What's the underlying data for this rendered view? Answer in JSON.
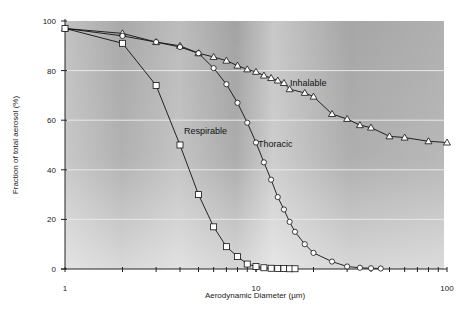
{
  "chart_data": {
    "type": "line",
    "title": "",
    "xlabel": "Aerodynamic Diameter (µm)",
    "ylabel": "Fraction of total aerosol  (%)",
    "xscale": "log",
    "xlim": [
      1,
      100
    ],
    "ylim": [
      0,
      100
    ],
    "x_tick_labels": [
      "1",
      "10",
      "100"
    ],
    "y_tick_labels": [
      "0",
      "20",
      "40",
      "60",
      "80",
      "100"
    ],
    "grid": "horizontal",
    "legend": "inline labels",
    "series": [
      {
        "name": "Inhalable",
        "marker": "triangle",
        "label_position": {
          "x": 290,
          "y": 86
        },
        "x": [
          1,
          2,
          3,
          4,
          5,
          6,
          7,
          8,
          9,
          10,
          11,
          12,
          13,
          14,
          15,
          18,
          20,
          25,
          30,
          35,
          40,
          50,
          60,
          80,
          100
        ],
        "values": [
          97,
          95,
          91.5,
          90,
          87,
          85.5,
          84,
          82,
          80.5,
          79.5,
          78,
          77,
          76,
          75,
          72.5,
          71,
          69.5,
          62.5,
          60.5,
          58,
          57,
          53.5,
          53,
          51.5,
          51
        ]
      },
      {
        "name": "Thoracic",
        "marker": "circle",
        "label_position": {
          "x": 258,
          "y": 147
        },
        "x": [
          1,
          2,
          3,
          4,
          5,
          6,
          7,
          8,
          9,
          10,
          11,
          12,
          13,
          14,
          15,
          16,
          18,
          20,
          25,
          30,
          35,
          40,
          45
        ],
        "values": [
          97,
          94,
          91.5,
          89.5,
          87,
          81,
          74.5,
          67,
          59,
          51,
          43,
          36,
          29,
          24,
          19,
          15,
          10,
          6.5,
          3,
          1,
          0.5,
          0.3,
          0.2
        ]
      },
      {
        "name": "Respirable",
        "marker": "square",
        "label_position": {
          "x": 184,
          "y": 134
        },
        "x": [
          1,
          2,
          3,
          4,
          5,
          6,
          7,
          8,
          9,
          10,
          11,
          12,
          13,
          14,
          15,
          16
        ],
        "values": [
          97,
          91,
          74,
          50,
          30,
          17,
          9,
          5,
          2,
          1,
          0.5,
          0.3,
          0.2,
          0.2,
          0.1,
          0.1
        ]
      }
    ]
  },
  "colors": {
    "plot_background": "#b8b8b8",
    "line": "#111111",
    "marker_fill": "#ffffff",
    "gridline": "#e8e8e8"
  }
}
